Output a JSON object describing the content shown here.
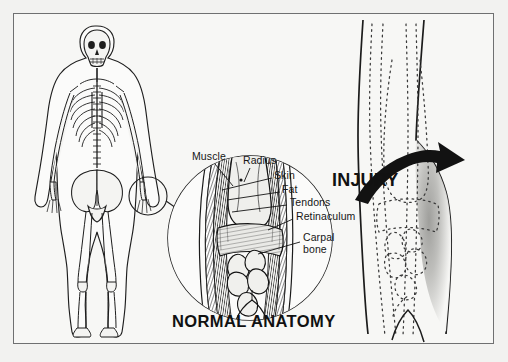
{
  "figure": {
    "kind": "medical-illustration",
    "background_color": "#f2f2f0",
    "paper_color": "#f7f7f5",
    "border_color": "#6f7071",
    "ink_color": "#161616"
  },
  "panels": {
    "left": {
      "name": "skeleton-overview",
      "content": "anterior full-body skeleton inside body outline with wrist highlight circle"
    },
    "center": {
      "name": "normal-anatomy-detail",
      "caption": "NORMAL ANATOMY",
      "content": "magnified cutaway of the wrist showing layered tissues"
    },
    "right": {
      "name": "injury-detail",
      "caption": "INJURY",
      "content": "dotted outline of wrist with shaded swelling and curved arrow"
    }
  },
  "callouts": [
    {
      "label": "Muscle",
      "x": 192,
      "y": 152
    },
    {
      "label": "Radius",
      "x": 243,
      "y": 159
    },
    {
      "label": "Skin",
      "x": 274,
      "y": 174
    },
    {
      "label": "Fat",
      "x": 282,
      "y": 188
    },
    {
      "label": "Tendons",
      "x": 290,
      "y": 201
    },
    {
      "label": "Retinaculum",
      "x": 296,
      "y": 215
    },
    {
      "label": "Carpal",
      "x": 303,
      "y": 236
    },
    {
      "label": "bone",
      "x": 303,
      "y": 248
    }
  ],
  "captions": {
    "normal": "NORMAL ANATOMY",
    "injury": "INJURY"
  },
  "arrow": {
    "name": "injury-arrow",
    "direction": "curving right toward swelling"
  }
}
